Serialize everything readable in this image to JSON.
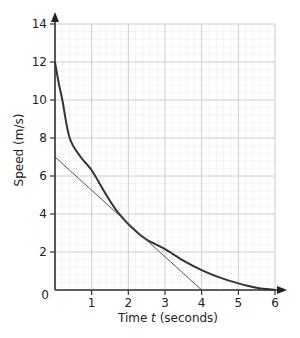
{
  "chart_data": {
    "type": "line",
    "title": "",
    "xlabel": "Time t (seconds)",
    "xlabel_parts": {
      "pre": "Time ",
      "var": "t",
      "post": " (seconds)"
    },
    "ylabel": "Speed (m/s)",
    "xlim": [
      0,
      6
    ],
    "ylim": [
      0,
      14
    ],
    "x_ticks": [
      0,
      1,
      2,
      3,
      4,
      5,
      6
    ],
    "y_ticks": [
      2,
      4,
      6,
      8,
      10,
      12,
      14
    ],
    "origin_label": "0",
    "grid": {
      "major_x": 1,
      "minor_x": 0.2,
      "major_y": 2,
      "minor_y": 0.4,
      "on": true
    },
    "series": [
      {
        "name": "speed-curve",
        "style": "thick",
        "x": [
          0,
          0.1,
          0.2,
          0.4,
          0.7,
          1.0,
          1.4,
          1.75,
          2.2,
          2.5,
          3.0,
          3.5,
          4.0,
          4.5,
          5.0,
          5.5,
          6.0
        ],
        "y": [
          12,
          10.9,
          10.0,
          8.0,
          7.0,
          6.3,
          5.0,
          4.0,
          3.1,
          2.65,
          2.15,
          1.55,
          1.05,
          0.65,
          0.35,
          0.12,
          0
        ]
      },
      {
        "name": "tangent-line",
        "style": "thin",
        "x": [
          0,
          4
        ],
        "y": [
          7,
          0
        ]
      }
    ],
    "annotations": [
      {
        "type": "tangent-point",
        "x": 1.75,
        "y": 4
      }
    ]
  }
}
